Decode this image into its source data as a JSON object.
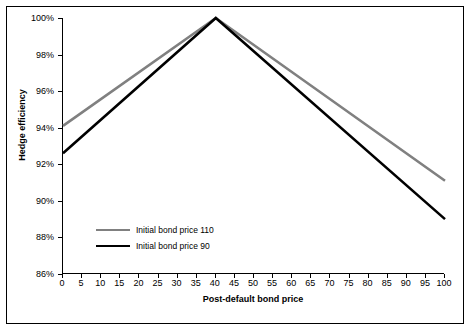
{
  "chart_data": {
    "type": "line",
    "title": "",
    "xlabel": "Post-default bond price",
    "ylabel": "Hedge efficiency",
    "xlim": [
      0,
      100
    ],
    "ylim": [
      86,
      100
    ],
    "xticks": [
      0,
      5,
      10,
      15,
      20,
      25,
      30,
      35,
      40,
      45,
      50,
      55,
      60,
      65,
      70,
      75,
      80,
      85,
      90,
      95,
      100
    ],
    "yticks": [
      "86%",
      "88%",
      "90%",
      "92%",
      "94%",
      "96%",
      "98%",
      "100%"
    ],
    "grid": false,
    "legend_position": "lower-left-inside",
    "series": [
      {
        "name": "Initial bond price 110",
        "color": "#808080",
        "x": [
          0,
          40,
          100
        ],
        "values": [
          94.1,
          100.0,
          91.1
        ]
      },
      {
        "name": "Initial bond price 90",
        "color": "#000000",
        "x": [
          0,
          40,
          100
        ],
        "values": [
          92.6,
          100.0,
          89.0
        ]
      }
    ]
  },
  "axis": {
    "x_title": "Post-default bond price",
    "y_title": "Hedge efficiency"
  },
  "legend": {
    "items": [
      {
        "label": "Initial bond price 110"
      },
      {
        "label": "Initial bond price 90"
      }
    ]
  }
}
